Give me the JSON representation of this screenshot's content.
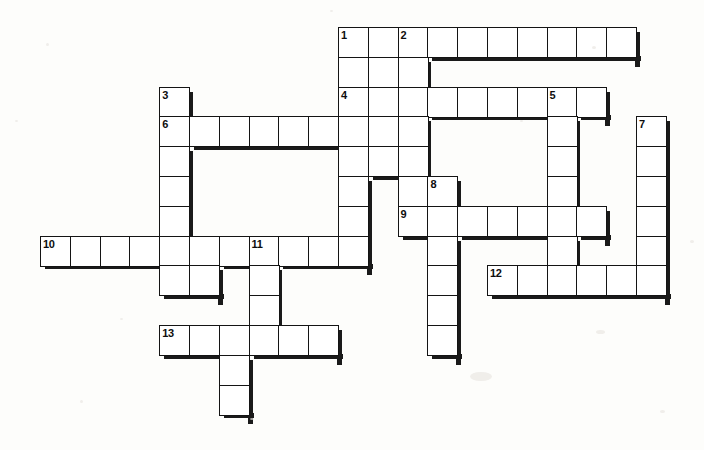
{
  "puzzle": {
    "title": "Crossword Grid",
    "cell_size": 29.8,
    "origin_x": 40,
    "origin_y": 27,
    "cell_fill": "#ffffff",
    "border_color": "#141414",
    "shadow_color": "#1a1a1a",
    "background": "#fdfdfb",
    "entries": [
      {
        "number": "1",
        "row": 0,
        "col": 10,
        "length": 10,
        "direction": "across"
      },
      {
        "number": "1",
        "row": 0,
        "col": 10,
        "length": 3,
        "direction": "down"
      },
      {
        "number": "2",
        "row": 0,
        "col": 12,
        "length": 8,
        "direction": "down"
      },
      {
        "number": "3",
        "row": 2,
        "col": 4,
        "length": 8,
        "direction": "down"
      },
      {
        "number": "4",
        "row": 2,
        "col": 10,
        "length": 8,
        "direction": "across"
      },
      {
        "number": "5",
        "row": 2,
        "col": 17,
        "length": 7,
        "direction": "down"
      },
      {
        "number": "6",
        "row": 3,
        "col": 4,
        "length": 7,
        "direction": "across"
      },
      {
        "number": "7",
        "row": 3,
        "col": 20,
        "length": 6,
        "direction": "down"
      },
      {
        "number": "8",
        "row": 5,
        "col": 13,
        "length": 1,
        "direction": "across"
      },
      {
        "number": "9",
        "row": 6,
        "col": 12,
        "length": 7,
        "direction": "across"
      },
      {
        "number": "10",
        "row": 7,
        "col": 0,
        "length": 11,
        "direction": "across"
      },
      {
        "number": "11",
        "row": 7,
        "col": 7,
        "length": 4,
        "direction": "down"
      },
      {
        "number": "12",
        "row": 8,
        "col": 15,
        "length": 6,
        "direction": "across"
      },
      {
        "number": "13",
        "row": 10,
        "col": 4,
        "length": 6,
        "direction": "across"
      }
    ],
    "cells": [
      {
        "r": 0,
        "c": 10,
        "num": "1"
      },
      {
        "r": 0,
        "c": 11
      },
      {
        "r": 0,
        "c": 12,
        "num": "2"
      },
      {
        "r": 0,
        "c": 13
      },
      {
        "r": 0,
        "c": 14
      },
      {
        "r": 0,
        "c": 15
      },
      {
        "r": 0,
        "c": 16
      },
      {
        "r": 0,
        "c": 17
      },
      {
        "r": 0,
        "c": 18
      },
      {
        "r": 0,
        "c": 19
      },
      {
        "r": 1,
        "c": 10
      },
      {
        "r": 1,
        "c": 11
      },
      {
        "r": 1,
        "c": 12
      },
      {
        "r": 2,
        "c": 4,
        "num": "3"
      },
      {
        "r": 2,
        "c": 10,
        "num": "4"
      },
      {
        "r": 2,
        "c": 11
      },
      {
        "r": 2,
        "c": 12
      },
      {
        "r": 2,
        "c": 13
      },
      {
        "r": 2,
        "c": 14
      },
      {
        "r": 2,
        "c": 15
      },
      {
        "r": 2,
        "c": 16
      },
      {
        "r": 2,
        "c": 17,
        "num": "5"
      },
      {
        "r": 2,
        "c": 18
      },
      {
        "r": 3,
        "c": 4,
        "num": "6"
      },
      {
        "r": 3,
        "c": 5
      },
      {
        "r": 3,
        "c": 6
      },
      {
        "r": 3,
        "c": 7
      },
      {
        "r": 3,
        "c": 8
      },
      {
        "r": 3,
        "c": 9
      },
      {
        "r": 3,
        "c": 10
      },
      {
        "r": 3,
        "c": 11
      },
      {
        "r": 3,
        "c": 12
      },
      {
        "r": 3,
        "c": 17
      },
      {
        "r": 3,
        "c": 20,
        "num": "7"
      },
      {
        "r": 4,
        "c": 4
      },
      {
        "r": 4,
        "c": 10
      },
      {
        "r": 4,
        "c": 11
      },
      {
        "r": 4,
        "c": 12
      },
      {
        "r": 4,
        "c": 17
      },
      {
        "r": 4,
        "c": 20
      },
      {
        "r": 5,
        "c": 4
      },
      {
        "r": 5,
        "c": 10
      },
      {
        "r": 5,
        "c": 12
      },
      {
        "r": 5,
        "c": 13,
        "num": "8"
      },
      {
        "r": 5,
        "c": 17
      },
      {
        "r": 5,
        "c": 20
      },
      {
        "r": 6,
        "c": 4
      },
      {
        "r": 6,
        "c": 10
      },
      {
        "r": 6,
        "c": 12,
        "num": "9"
      },
      {
        "r": 6,
        "c": 13
      },
      {
        "r": 6,
        "c": 14
      },
      {
        "r": 6,
        "c": 15
      },
      {
        "r": 6,
        "c": 16
      },
      {
        "r": 6,
        "c": 17
      },
      {
        "r": 6,
        "c": 18
      },
      {
        "r": 6,
        "c": 20
      },
      {
        "r": 7,
        "c": 0,
        "num": "10"
      },
      {
        "r": 7,
        "c": 1
      },
      {
        "r": 7,
        "c": 2
      },
      {
        "r": 7,
        "c": 3
      },
      {
        "r": 7,
        "c": 4
      },
      {
        "r": 7,
        "c": 5
      },
      {
        "r": 7,
        "c": 6
      },
      {
        "r": 7,
        "c": 7,
        "num": "11"
      },
      {
        "r": 7,
        "c": 8
      },
      {
        "r": 7,
        "c": 9
      },
      {
        "r": 7,
        "c": 10
      },
      {
        "r": 7,
        "c": 13
      },
      {
        "r": 7,
        "c": 17
      },
      {
        "r": 7,
        "c": 20
      },
      {
        "r": 8,
        "c": 4
      },
      {
        "r": 8,
        "c": 5
      },
      {
        "r": 8,
        "c": 7
      },
      {
        "r": 8,
        "c": 13
      },
      {
        "r": 8,
        "c": 15,
        "num": "12"
      },
      {
        "r": 8,
        "c": 16
      },
      {
        "r": 8,
        "c": 17
      },
      {
        "r": 8,
        "c": 18
      },
      {
        "r": 8,
        "c": 19
      },
      {
        "r": 8,
        "c": 20
      },
      {
        "r": 9,
        "c": 7
      },
      {
        "r": 9,
        "c": 13
      },
      {
        "r": 10,
        "c": 4,
        "num": "13"
      },
      {
        "r": 10,
        "c": 5
      },
      {
        "r": 10,
        "c": 6
      },
      {
        "r": 10,
        "c": 7
      },
      {
        "r": 10,
        "c": 8
      },
      {
        "r": 10,
        "c": 9
      },
      {
        "r": 10,
        "c": 13
      },
      {
        "r": 11,
        "c": 6
      },
      {
        "r": 12,
        "c": 6
      }
    ]
  }
}
